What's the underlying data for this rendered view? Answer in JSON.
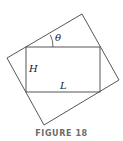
{
  "figure": {
    "caption": "FIGURE 18",
    "labels": {
      "angle": "θ",
      "height": "H",
      "length": "L"
    },
    "colors": {
      "line": "#444444",
      "text": "#222222",
      "caption": "#6b6b6b"
    },
    "outer_square": {
      "vertices": [
        [
          82,
          14
        ],
        [
          119,
          80
        ],
        [
          44,
          125
        ],
        [
          7,
          58
        ]
      ]
    },
    "inner_rectangle": {
      "x": 26,
      "y": 47,
      "width": 74,
      "height": 45
    }
  }
}
